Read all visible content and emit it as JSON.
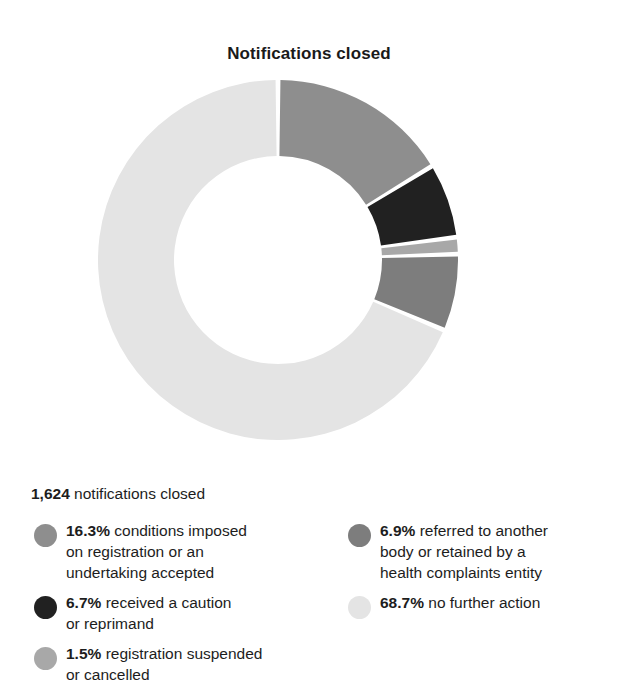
{
  "chart_data": {
    "type": "pie",
    "variant": "donut",
    "title": "Notifications closed",
    "xlabel": "",
    "ylabel": "",
    "legend_position": "bottom",
    "grid": false,
    "total_value": 1624,
    "total_label_number": "1,624",
    "total_label_text": "notifications closed",
    "value_unit": "%",
    "start_angle_deg": 0,
    "direction": "clockwise",
    "categories": [
      "conditions imposed on registration or an undertaking accepted",
      "received a caution or reprimand",
      "registration suspended or cancelled",
      "referred to another body or retained by a health complaints entity",
      "no further action"
    ],
    "values": [
      16.3,
      6.7,
      1.5,
      6.9,
      68.7
    ],
    "colors": [
      "#8e8e8e",
      "#212121",
      "#a8a8a8",
      "#7d7d7d",
      "#e4e4e4"
    ],
    "slices": [
      {
        "pct": "16.3%",
        "label": "conditions imposed on registration or an undertaking accepted",
        "value": 16.3,
        "color": "#8e8e8e"
      },
      {
        "pct": "6.7%",
        "label": "received a caution or reprimand",
        "value": 6.7,
        "color": "#212121"
      },
      {
        "pct": "1.5%",
        "label": "registration suspended or cancelled",
        "value": 1.5,
        "color": "#a8a8a8"
      },
      {
        "pct": "6.9%",
        "label": "referred to another body or retained by a health complaints entity",
        "value": 6.9,
        "color": "#7d7d7d"
      },
      {
        "pct": "68.7%",
        "label": "no further action",
        "value": 68.7,
        "color": "#e4e4e4"
      }
    ]
  },
  "title": "Notifications closed",
  "summary": {
    "total": "1,624",
    "text": "notifications closed"
  },
  "legend": {
    "left": [
      {
        "pct": "16.3%",
        "label": "conditions imposed",
        "label_line2": "on registration or an",
        "label_line3": "undertaking accepted",
        "color": "#8e8e8e"
      },
      {
        "pct": "6.7%",
        "label": "received a caution",
        "label_line2": "or reprimand",
        "label_line3": "",
        "color": "#212121"
      },
      {
        "pct": "1.5%",
        "label": "registration suspended",
        "label_line2": "or cancelled",
        "label_line3": "",
        "color": "#a8a8a8"
      }
    ],
    "right": [
      {
        "pct": "6.9%",
        "label": "referred to another",
        "label_line2": "body or retained by a",
        "label_line3": "health complaints entity",
        "color": "#7d7d7d"
      },
      {
        "pct": "68.7%",
        "label": "no further action",
        "label_line2": "",
        "label_line3": "",
        "color": "#e4e4e4"
      }
    ]
  }
}
